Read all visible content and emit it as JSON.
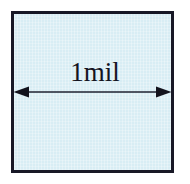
{
  "diagram": {
    "type": "dimension-annotation",
    "shape": {
      "name": "square",
      "fill_color": "#d8edf4",
      "border_color": "#181826",
      "border_width_px": 3
    },
    "dimension": {
      "label": "1mil",
      "value": 1,
      "unit": "mil",
      "orientation": "horizontal",
      "arrow_style": "double-headed",
      "line_color": "#1e2030"
    },
    "background_color": "#ffffff"
  }
}
